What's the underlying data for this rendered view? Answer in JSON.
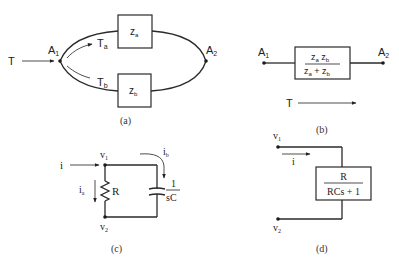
{
  "panels": {
    "a": {
      "caption": "(a)",
      "input_label": "T",
      "node_in": {
        "main": "A",
        "sub": "1"
      },
      "node_out": {
        "main": "A",
        "sub": "2"
      },
      "branch_a_label": {
        "main": "T",
        "sub": "a"
      },
      "branch_b_label": {
        "main": "T",
        "sub": "b"
      },
      "box_a": {
        "main": "z",
        "sub": "a"
      },
      "box_b": {
        "main": "z",
        "sub": "b"
      }
    },
    "b": {
      "caption": "(b)",
      "node_in": {
        "main": "A",
        "sub": "1"
      },
      "node_out": {
        "main": "A",
        "sub": "2"
      },
      "numerator": {
        "t1": "z",
        "s1": "a",
        "t2": " z",
        "s2": "b"
      },
      "denominator": {
        "t1": "z",
        "s1": "a",
        "t2": " + z",
        "s2": "b"
      },
      "flow_label": "T"
    },
    "c": {
      "caption": "(c)",
      "input_label": "i",
      "node_top": {
        "main": "v",
        "sub": "1"
      },
      "node_bottom": {
        "main": "v",
        "sub": "2"
      },
      "current_a": {
        "main": "i",
        "sub": "a"
      },
      "current_b": {
        "main": "i",
        "sub": "b"
      },
      "resistor_label": "R",
      "cap_numerator": "1",
      "cap_denominator": "sC"
    },
    "d": {
      "caption": "(d)",
      "node_top": {
        "main": "v",
        "sub": "1"
      },
      "node_bottom": {
        "main": "v",
        "sub": "2"
      },
      "current_label": "i",
      "numerator": "R",
      "denominator": "RCs + 1"
    }
  }
}
